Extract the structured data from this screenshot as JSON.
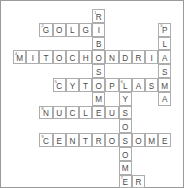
{
  "puzzle": {
    "title": "Cell Organelles Crossword",
    "grid": {
      "columns": 13,
      "rows": 13,
      "cell_width": 13.2,
      "cell_height": 13.8,
      "origin_x": 12,
      "origin_y": 8,
      "border_color": "#adadad",
      "letter_color": "#4b4b4b",
      "number_color": "#6d6d6d",
      "background": "#ffffff",
      "frame_color": "#9a9a9a"
    },
    "entries": [
      {
        "number": "1",
        "answer": "RIBOSOME",
        "direction": "down",
        "row": 0,
        "col": 6
      },
      {
        "number": "2",
        "answer": "GOLGI",
        "direction": "across",
        "row": 1,
        "col": 2
      },
      {
        "number": "3",
        "answer": "PLASMA",
        "direction": "down",
        "row": 1,
        "col": 11
      },
      {
        "number": "4",
        "answer": "MITOCHONDRIA",
        "direction": "across",
        "row": 3,
        "col": 0
      },
      {
        "number": "5",
        "answer": "CYTOPLASMA",
        "direction": "across",
        "row": 5,
        "col": 3
      },
      {
        "number": "6",
        "answer": "LYSOSOME",
        "direction": "down",
        "row": 5,
        "col": 7
      },
      {
        "number": "8",
        "answer": "NUCLEUS",
        "direction": "across",
        "row": 7,
        "col": 2
      },
      {
        "number": "9",
        "answer": "CENTROSOME",
        "direction": "across",
        "row": 8,
        "col": 2
      },
      {
        "number": "7",
        "answer": "ER",
        "direction": "across",
        "row": 12,
        "col": 7
      }
    ],
    "cells": [
      {
        "row": 0,
        "col": 6,
        "letter": "R",
        "number": "1"
      },
      {
        "row": 1,
        "col": 2,
        "letter": "G",
        "number": "2"
      },
      {
        "row": 1,
        "col": 3,
        "letter": "O",
        "number": ""
      },
      {
        "row": 1,
        "col": 4,
        "letter": "L",
        "number": ""
      },
      {
        "row": 1,
        "col": 5,
        "letter": "G",
        "number": ""
      },
      {
        "row": 1,
        "col": 6,
        "letter": "I",
        "number": ""
      },
      {
        "row": 1,
        "col": 11,
        "letter": "P",
        "number": "3"
      },
      {
        "row": 2,
        "col": 6,
        "letter": "B",
        "number": ""
      },
      {
        "row": 2,
        "col": 11,
        "letter": "L",
        "number": ""
      },
      {
        "row": 3,
        "col": 0,
        "letter": "M",
        "number": "4"
      },
      {
        "row": 3,
        "col": 1,
        "letter": "I",
        "number": ""
      },
      {
        "row": 3,
        "col": 2,
        "letter": "T",
        "number": ""
      },
      {
        "row": 3,
        "col": 3,
        "letter": "O",
        "number": ""
      },
      {
        "row": 3,
        "col": 4,
        "letter": "C",
        "number": ""
      },
      {
        "row": 3,
        "col": 5,
        "letter": "H",
        "number": ""
      },
      {
        "row": 3,
        "col": 6,
        "letter": "O",
        "number": ""
      },
      {
        "row": 3,
        "col": 7,
        "letter": "N",
        "number": ""
      },
      {
        "row": 3,
        "col": 8,
        "letter": "D",
        "number": ""
      },
      {
        "row": 3,
        "col": 9,
        "letter": "R",
        "number": ""
      },
      {
        "row": 3,
        "col": 10,
        "letter": "I",
        "number": ""
      },
      {
        "row": 3,
        "col": 11,
        "letter": "A",
        "number": ""
      },
      {
        "row": 4,
        "col": 6,
        "letter": "S",
        "number": ""
      },
      {
        "row": 4,
        "col": 11,
        "letter": "S",
        "number": ""
      },
      {
        "row": 5,
        "col": 3,
        "letter": "C",
        "number": "5"
      },
      {
        "row": 5,
        "col": 4,
        "letter": "Y",
        "number": ""
      },
      {
        "row": 5,
        "col": 5,
        "letter": "T",
        "number": ""
      },
      {
        "row": 5,
        "col": 6,
        "letter": "O",
        "number": ""
      },
      {
        "row": 5,
        "col": 7,
        "letter": "P",
        "number": ""
      },
      {
        "row": 5,
        "col": 8,
        "letter": "L",
        "number": "6"
      },
      {
        "row": 5,
        "col": 9,
        "letter": "A",
        "number": ""
      },
      {
        "row": 5,
        "col": 10,
        "letter": "S",
        "number": ""
      },
      {
        "row": 5,
        "col": 11,
        "letter": "M",
        "number": ""
      },
      {
        "row": 6,
        "col": 6,
        "letter": "M",
        "number": ""
      },
      {
        "row": 6,
        "col": 8,
        "letter": "Y",
        "number": ""
      },
      {
        "row": 6,
        "col": 11,
        "letter": "A",
        "number": ""
      },
      {
        "row": 7,
        "col": 2,
        "letter": "N",
        "number": "8"
      },
      {
        "row": 7,
        "col": 3,
        "letter": "U",
        "number": ""
      },
      {
        "row": 7,
        "col": 4,
        "letter": "C",
        "number": ""
      },
      {
        "row": 7,
        "col": 5,
        "letter": "L",
        "number": ""
      },
      {
        "row": 7,
        "col": 6,
        "letter": "E",
        "number": ""
      },
      {
        "row": 7,
        "col": 7,
        "letter": "U",
        "number": ""
      },
      {
        "row": 7,
        "col": 8,
        "letter": "S",
        "number": ""
      },
      {
        "row": 8,
        "col": 8,
        "letter": "O",
        "number": ""
      },
      {
        "row": 9,
        "col": 2,
        "letter": "C",
        "number": "9"
      },
      {
        "row": 9,
        "col": 3,
        "letter": "E",
        "number": ""
      },
      {
        "row": 9,
        "col": 4,
        "letter": "N",
        "number": ""
      },
      {
        "row": 9,
        "col": 5,
        "letter": "T",
        "number": ""
      },
      {
        "row": 9,
        "col": 6,
        "letter": "R",
        "number": ""
      },
      {
        "row": 9,
        "col": 7,
        "letter": "O",
        "number": ""
      },
      {
        "row": 9,
        "col": 8,
        "letter": "S",
        "number": ""
      },
      {
        "row": 9,
        "col": 9,
        "letter": "O",
        "number": ""
      },
      {
        "row": 9,
        "col": 10,
        "letter": "M",
        "number": ""
      },
      {
        "row": 9,
        "col": 11,
        "letter": "E",
        "number": ""
      },
      {
        "row": 10,
        "col": 8,
        "letter": "O",
        "number": ""
      },
      {
        "row": 11,
        "col": 8,
        "letter": "M",
        "number": ""
      },
      {
        "row": 12,
        "col": 8,
        "letter": "E",
        "number": "7"
      },
      {
        "row": 12,
        "col": 9,
        "letter": "R",
        "number": ""
      }
    ]
  }
}
